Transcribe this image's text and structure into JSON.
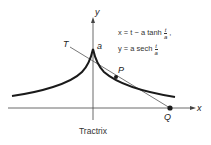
{
  "figure": {
    "caption": "Tractrix",
    "axis_labels": {
      "x": "x",
      "y": "y"
    },
    "point_labels": {
      "a": "a",
      "T": "T",
      "P": "P",
      "Q": "Q"
    },
    "equations": {
      "x_lhs": "x = t − a tanh",
      "y_lhs": "y = a sech",
      "frac_num": "t",
      "frac_den": "a",
      "x_trail": ","
    },
    "colors": {
      "curve": "#1a1a1a",
      "axis": "#444444",
      "tangent": "#555555"
    }
  }
}
